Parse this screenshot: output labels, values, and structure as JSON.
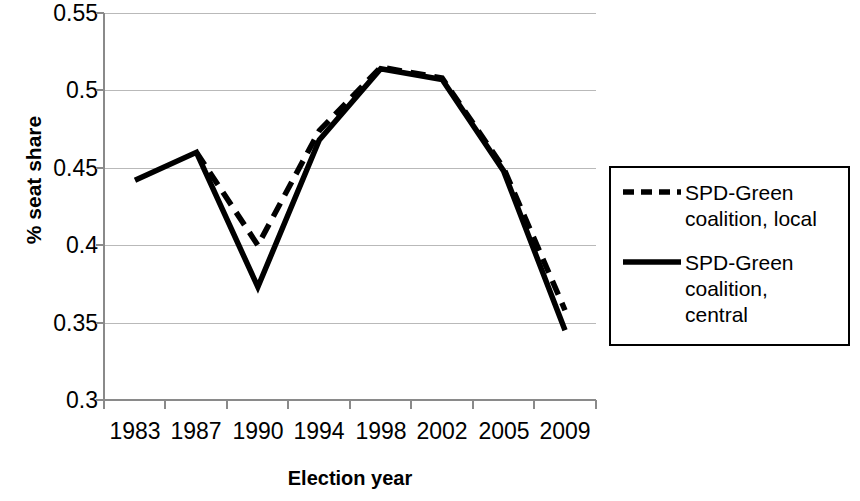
{
  "chart_data": {
    "type": "line",
    "title": "",
    "xlabel": "Election year",
    "ylabel": "% seat share",
    "categories": [
      "1983",
      "1987",
      "1990",
      "1994",
      "1998",
      "2002",
      "2005",
      "2009"
    ],
    "ylim": [
      0.3,
      0.55
    ],
    "yticks": [
      "0.3",
      "0.35",
      "0.4",
      "0.45",
      "0.5",
      "0.55"
    ],
    "ytick_values": [
      0.3,
      0.35,
      0.4,
      0.45,
      0.5,
      0.55
    ],
    "grid": "horizontal",
    "legend_position": "right",
    "series": [
      {
        "name": "SPD-Green coalition, local",
        "style": "dashed",
        "color": "#000000",
        "values": [
          null,
          0.46,
          0.4,
          0.474,
          0.515,
          0.508,
          0.45,
          0.358
        ]
      },
      {
        "name": "SPD-Green coalition, central",
        "style": "solid",
        "color": "#000000",
        "values": [
          0.442,
          0.46,
          0.373,
          0.468,
          0.514,
          0.507,
          0.448,
          0.345
        ]
      }
    ]
  },
  "legend": {
    "items": [
      {
        "label": "SPD-Green\ncoalition, local",
        "style": "dashed"
      },
      {
        "label": "SPD-Green\ncoalition,\ncentral",
        "style": "solid"
      }
    ]
  }
}
